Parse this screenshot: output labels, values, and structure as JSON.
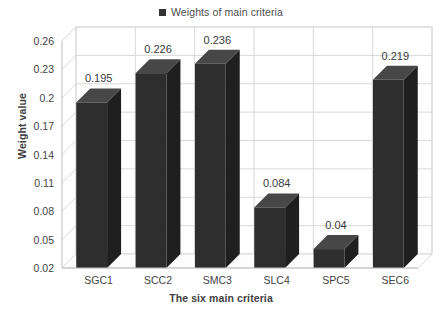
{
  "chart_data": {
    "type": "bar",
    "title": "",
    "subtitle": "",
    "categories": [
      "SGC1",
      "SCC2",
      "SMC3",
      "SLC4",
      "SPC5",
      "SEC6"
    ],
    "values": [
      0.195,
      0.226,
      0.236,
      0.084,
      0.04,
      0.219
    ],
    "data_labels": [
      "0.195",
      "0.226",
      "0.236",
      "0.084",
      "0.04",
      "0.219"
    ],
    "series": [
      {
        "name": "Weights of main criteria",
        "values": [
          0.195,
          0.226,
          0.236,
          0.084,
          0.04,
          0.219
        ]
      }
    ],
    "xlabel": "The six main criteria",
    "ylabel": "Weight value",
    "ylim": [
      0.02,
      0.26
    ],
    "ytick_values": [
      0.02,
      0.05,
      0.08,
      0.11,
      0.14,
      0.17,
      0.2,
      0.23,
      0.26
    ],
    "ytick_labels": [
      "0.02",
      "0.05",
      "0.08",
      "0.11",
      "0.14",
      "0.17",
      "0.2",
      "0.23",
      "0.26"
    ],
    "grid": true,
    "grid_axis": "both",
    "legend": {
      "position": "top",
      "entries": [
        "Weights of main criteria"
      ],
      "marker": "filled-square"
    },
    "style": "3d-column",
    "colors": {
      "bar_front": "#2e2e2e",
      "bar_top": "#474747",
      "bar_side": "#1f1f1f",
      "gridline": "#d9d9d9",
      "axis_line": "#bfbfbf",
      "text": "#444444",
      "background": "#ffffff"
    }
  },
  "legend": {
    "label": "Weights of main criteria"
  },
  "axes": {
    "y_title": "Weight value",
    "x_title": "The six main criteria"
  }
}
